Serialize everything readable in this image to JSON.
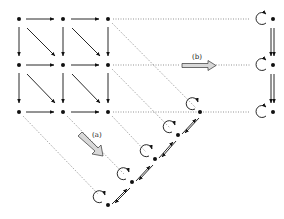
{
  "diagram": {
    "grid": {
      "rows": 3,
      "cols": 3
    },
    "labels": {
      "a": "(a)",
      "b": "(b)"
    },
    "right_column": {
      "nodes": 3,
      "self_loops": true,
      "edges": "double-down"
    },
    "diagonal_chain": {
      "nodes": 5,
      "self_loops": true,
      "edges": "bidirectional"
    },
    "colors": {
      "ink": "#111111",
      "dotted": "#666666",
      "block_arrow_fill": "#d8d8d8"
    }
  }
}
